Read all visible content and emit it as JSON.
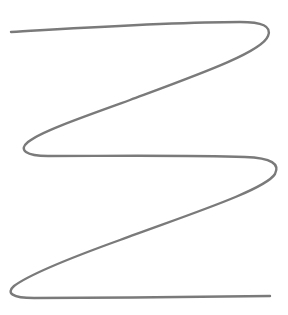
{
  "drawing": {
    "description": "Single continuous hand-drawn serpentine zigzag line",
    "stroke_color": "#7a7a7a",
    "stroke_width": 2.4,
    "background": "#ffffff",
    "path": "M 11 32 C 80 28, 170 22, 240 22 C 262 22, 272 26, 268 36 C 262 52, 200 74, 130 100 C 80 118, 40 132, 28 142 C 18 150, 26 156, 48 156 C 110 156, 190 155, 245 157 C 272 158, 280 164, 275 174 C 265 190, 190 214, 120 240 C 70 258, 30 274, 14 286 C 6 293, 12 298, 34 298 C 110 298, 200 297, 270 296"
  }
}
